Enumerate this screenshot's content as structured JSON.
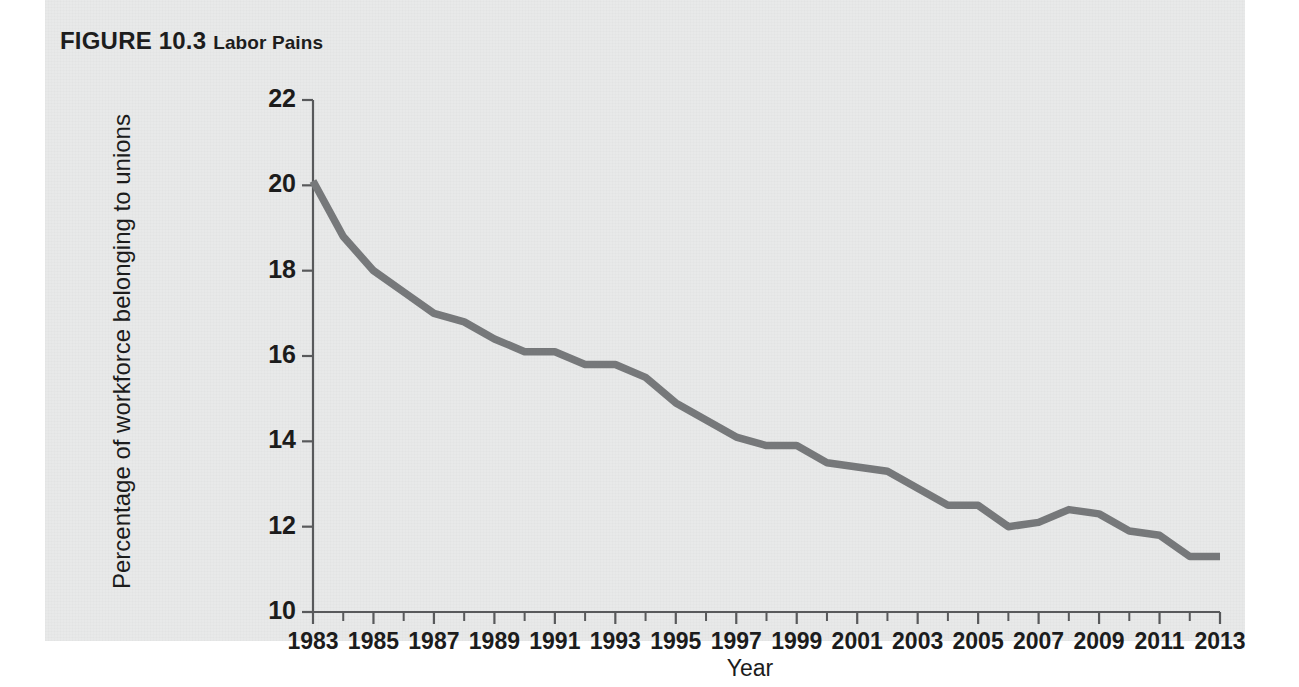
{
  "figure": {
    "label": "FIGURE 10.3",
    "name": "Labor Pains"
  },
  "colors": {
    "panel_background": "#e8e9e9",
    "page_background": "#ffffff",
    "line": "#76787a",
    "axis": "#58595b",
    "text": "#1c1c1c"
  },
  "chart_data": {
    "type": "line",
    "title": "Labor Pains",
    "xlabel": "Year",
    "ylabel": "Percentage of workforce belonging to unions",
    "xlim": [
      1983,
      2013
    ],
    "ylim": [
      10,
      22
    ],
    "ytick_labels": [
      "22",
      "20",
      "18",
      "16",
      "14",
      "12",
      "10"
    ],
    "ytick_values": [
      22,
      20,
      18,
      16,
      14,
      12,
      10
    ],
    "xtick_labels": [
      "1983",
      "1985",
      "1987",
      "1989",
      "1991",
      "1993",
      "1995",
      "1997",
      "1999",
      "2001",
      "2003",
      "2005",
      "2007",
      "2009",
      "2011",
      "2013"
    ],
    "xtick_values": [
      1983,
      1985,
      1987,
      1989,
      1991,
      1993,
      1995,
      1997,
      1999,
      2001,
      2003,
      2005,
      2007,
      2009,
      2011,
      2013
    ],
    "minor_tick_interval": 1,
    "grid": false,
    "legend": null,
    "x": [
      1983,
      1984,
      1985,
      1986,
      1987,
      1988,
      1989,
      1990,
      1991,
      1992,
      1993,
      1994,
      1995,
      1996,
      1997,
      1998,
      1999,
      2000,
      2001,
      2002,
      2003,
      2004,
      2005,
      2006,
      2007,
      2008,
      2009,
      2010,
      2011,
      2012,
      2013
    ],
    "values": [
      20.1,
      18.8,
      18.0,
      17.5,
      17.0,
      16.8,
      16.4,
      16.1,
      16.1,
      15.8,
      15.8,
      15.5,
      14.9,
      14.5,
      14.1,
      13.9,
      13.9,
      13.5,
      13.4,
      13.3,
      12.9,
      12.5,
      12.5,
      12.0,
      12.1,
      12.4,
      12.3,
      11.9,
      11.8,
      11.3,
      11.3
    ],
    "series_name": "Percentage of workforce belonging to unions"
  }
}
